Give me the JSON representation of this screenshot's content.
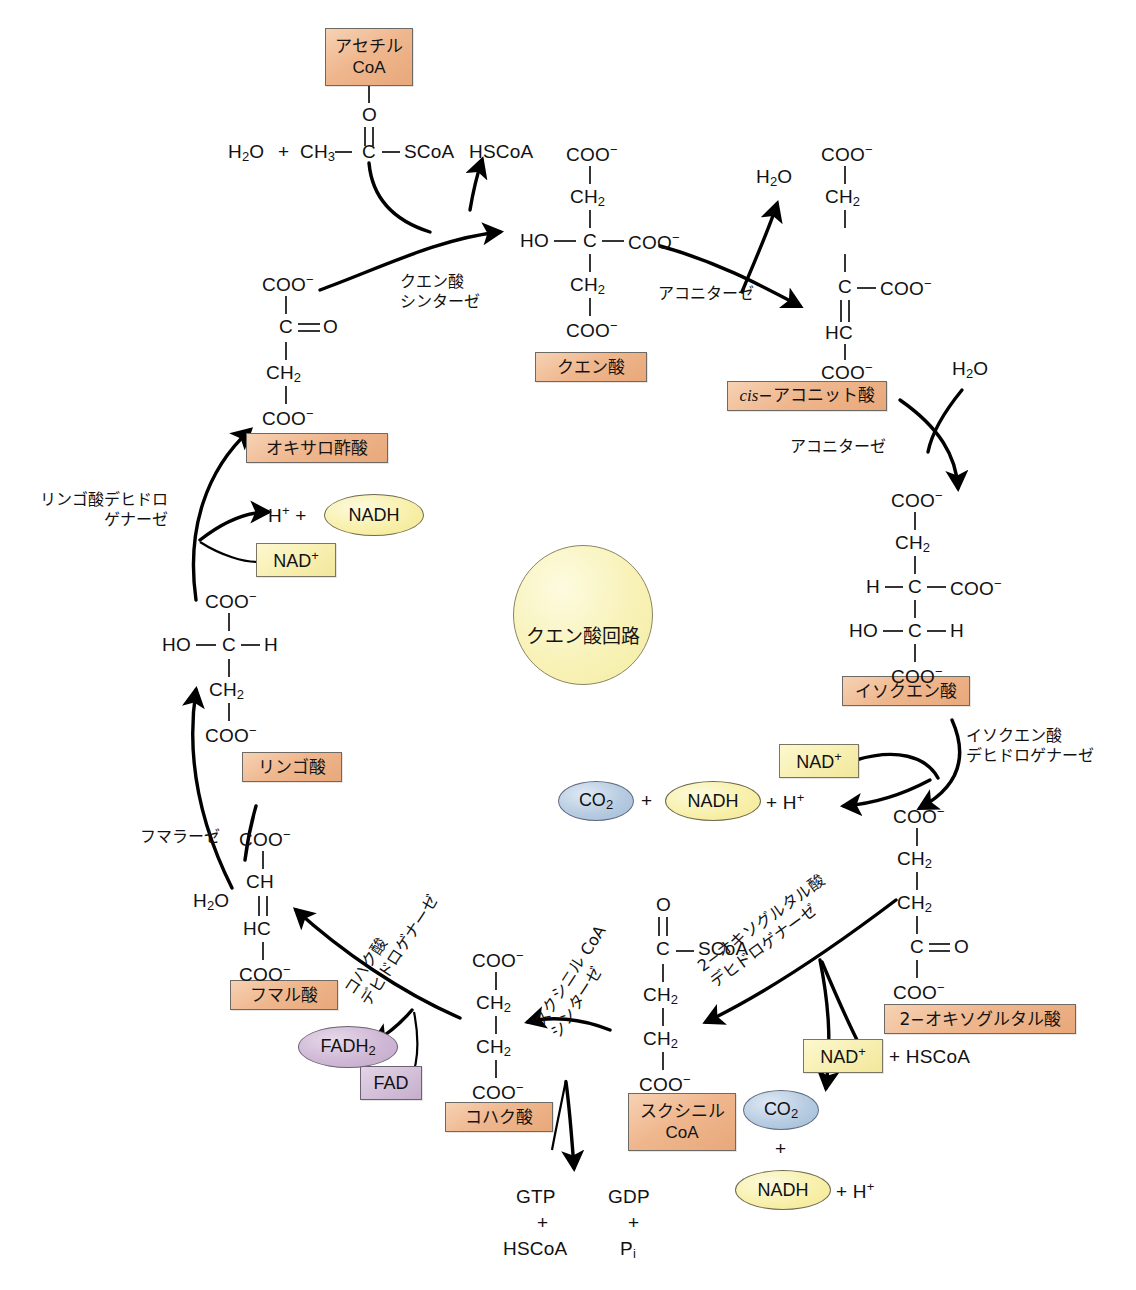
{
  "diagram": {
    "center_label": "クエン酸回路",
    "type": "metabolic-pathway"
  },
  "metabolites": [
    {
      "id": "acetyl-coa",
      "label": "アセチル\nCoA",
      "line1": "アセチル",
      "line2": "CoA"
    },
    {
      "id": "citrate",
      "label": "クエン酸"
    },
    {
      "id": "cis-aconitate",
      "label_italic": "cis",
      "label_rest": "−アコニット酸"
    },
    {
      "id": "isocitrate",
      "label": "イソクエン酸"
    },
    {
      "id": "2-oxoglutarate",
      "label": "2−オキソグルタル酸"
    },
    {
      "id": "succinyl-coa",
      "line1": "スクシニル",
      "line2": "CoA"
    },
    {
      "id": "succinate",
      "label": "コハク酸"
    },
    {
      "id": "fumarate",
      "label": "フマル酸"
    },
    {
      "id": "malate",
      "label": "リンゴ酸"
    },
    {
      "id": "oxaloacetate",
      "label": "オキサロ酢酸"
    }
  ],
  "enzymes": [
    {
      "id": "citrate-synthase",
      "line1": "クエン酸",
      "line2": "シンターゼ"
    },
    {
      "id": "aconitase-1",
      "label": "アコニターゼ"
    },
    {
      "id": "aconitase-2",
      "label": "アコニターゼ"
    },
    {
      "id": "isocitrate-dh",
      "line1": "イソクエン酸",
      "line2": "デヒドロゲナーゼ"
    },
    {
      "id": "oxoglutarate-dh",
      "line1": "2−オキソグルタル酸",
      "line2": "デヒドロゲナーゼ"
    },
    {
      "id": "succinyl-coa-synthetase",
      "line1": "スクシニル CoA",
      "line2": "シンターゼ"
    },
    {
      "id": "succinate-dh",
      "line1": "コハク酸",
      "line2": "デヒドロゲナーゼ"
    },
    {
      "id": "fumarase",
      "label": "フマラーゼ"
    },
    {
      "id": "malate-dh",
      "line1": "リンゴ酸デヒドロ",
      "line2": "ゲナーゼ"
    }
  ],
  "cofactors": {
    "nad_plus": "NAD",
    "nad_plus_sup": "+",
    "nadh": "NADH",
    "fad": "FAD",
    "fadh2": "FADH",
    "fadh2_sub": "2",
    "co2": "CO",
    "co2_sub": "2"
  },
  "small_molecules": {
    "water": "H",
    "water_sub": "2",
    "water_rest": "O",
    "proton": "H",
    "proton_sup": "+",
    "plus": "+",
    "hscoa": "HSCoA",
    "gtp": "GTP",
    "gdp": "GDP",
    "pi": "P",
    "pi_sub": "i",
    "plus_hscoa": "+ HSCoA",
    "plus_proton_label": "+ H"
  },
  "structures": {
    "acetyl_coa_chain": {
      "h2o": "H₂O",
      "plus": "+",
      "ch3": "CH₃",
      "c": "C",
      "o": "O",
      "scoa": "SCoA",
      "hscoa": "HSCoA"
    },
    "citrate": [
      "COO⁻",
      "CH₂",
      "HO",
      "C",
      "COO⁻",
      "CH₂",
      "COO⁻"
    ],
    "cis_aconitate": [
      "COO⁻",
      "CH₂",
      "C",
      "COO⁻",
      "HC",
      "COO⁻"
    ],
    "isocitrate": [
      "COO⁻",
      "CH₂",
      "H",
      "C",
      "COO⁻",
      "HO",
      "C",
      "H",
      "COO⁻"
    ],
    "oxoglutarate": [
      "COO⁻",
      "CH₂",
      "CH₂",
      "C",
      "O",
      "COO⁻"
    ],
    "succinyl_coa": [
      "O",
      "C",
      "SCoA",
      "CH₂",
      "CH₂",
      "COO⁻"
    ],
    "succinate": [
      "COO⁻",
      "CH₂",
      "CH₂",
      "COO⁻"
    ],
    "fumarate": [
      "COO⁻",
      "CH",
      "HC",
      "COO⁻"
    ],
    "malate": [
      "COO⁻",
      "HO",
      "C",
      "H",
      "CH₂",
      "COO⁻"
    ],
    "oxaloacetate": [
      "COO⁻",
      "C",
      "O",
      "CH₂",
      "COO⁻"
    ]
  },
  "colors": {
    "metabolite_box": "#efb68d",
    "cofactor_box": "#f7efb0",
    "nadh_ellipse": "#f8f0ab",
    "co2_ellipse": "#b9cde2",
    "fad_purple": "#d3bfd8",
    "center_circle": "#f8f2b8",
    "stroke": "#111111"
  }
}
